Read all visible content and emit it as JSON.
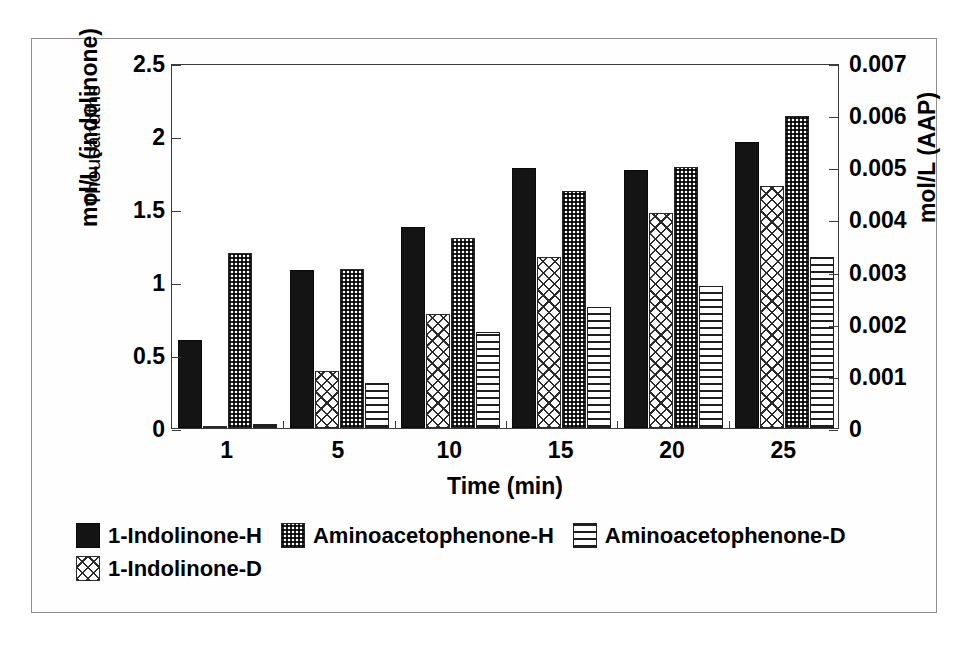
{
  "chart_data": {
    "type": "bar",
    "title": "",
    "xlabel": "Time (min)",
    "ylabel": "mol/L (indolinone)",
    "ylabel_secondary": "Thousandths",
    "ylabel_right": "mol/L (AAP)",
    "categories": [
      "1",
      "5",
      "10",
      "15",
      "20",
      "25"
    ],
    "ylim": [
      0,
      2.5
    ],
    "yticks": [
      "0",
      "0.5",
      "1",
      "1.5",
      "2",
      "2.5"
    ],
    "ytick_values": [
      0,
      0.5,
      1,
      1.5,
      2,
      2.5
    ],
    "ylim_right": [
      0,
      0.007
    ],
    "yticks_right": [
      "0",
      "0.001",
      "0.002",
      "0.003",
      "0.004",
      "0.005",
      "0.006",
      "0.007"
    ],
    "ytick_values_right": [
      0,
      0.001,
      0.002,
      0.003,
      0.004,
      0.005,
      0.006,
      0.007
    ],
    "grid": false,
    "legend_position": "bottom-left",
    "series": [
      {
        "name": "1-Indolinone-H",
        "pattern": "solid",
        "axis": "left",
        "values": [
          0.6,
          1.08,
          1.38,
          1.78,
          1.77,
          1.96
        ]
      },
      {
        "name": "1-Indolinone-D",
        "pattern": "cross-hatch",
        "axis": "left",
        "values": [
          0.0,
          0.39,
          0.78,
          1.17,
          1.47,
          1.66
        ]
      },
      {
        "name": "Aminoacetophenone-H",
        "pattern": "dotted",
        "axis": "left",
        "values": [
          1.2,
          1.09,
          1.3,
          1.62,
          1.79,
          2.14
        ]
      },
      {
        "name": "Aminoacetophenone-D",
        "pattern": "horizontal-lines",
        "axis": "left",
        "values": [
          0.03,
          0.31,
          0.66,
          0.83,
          0.97,
          1.17
        ]
      }
    ],
    "series_draw_order": [
      "1-Indolinone-H",
      "1-Indolinone-D",
      "Aminoacetophenone-H",
      "Aminoacetophenone-D"
    ],
    "legend_order": [
      "1-Indolinone-H",
      "Aminoacetophenone-H",
      "Aminoacetophenone-D",
      "1-Indolinone-D"
    ],
    "colors": {
      "ink": "#141414",
      "axis": "#3b3b3b",
      "frame": "#8c8c8c",
      "background": "#ffffff"
    }
  }
}
